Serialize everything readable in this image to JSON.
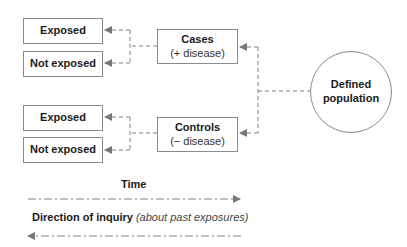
{
  "diagram": {
    "population": {
      "line1": "Defined",
      "line2": "population"
    },
    "cases": {
      "title": "Cases",
      "subtitle": "(+ disease)"
    },
    "controls": {
      "title": "Controls",
      "subtitle": "(− disease)"
    },
    "cases_outcomes": [
      {
        "label": "Exposed"
      },
      {
        "label": "Not exposed"
      }
    ],
    "controls_outcomes": [
      {
        "label": "Exposed"
      },
      {
        "label": "Not exposed"
      }
    ],
    "time_label": "Time",
    "inquiry_label": "Direction of inquiry",
    "inquiry_note": "(about past exposures)"
  },
  "colors": {
    "line": "#808080",
    "border": "#8a8a8a",
    "text": "#1a1a1a"
  }
}
